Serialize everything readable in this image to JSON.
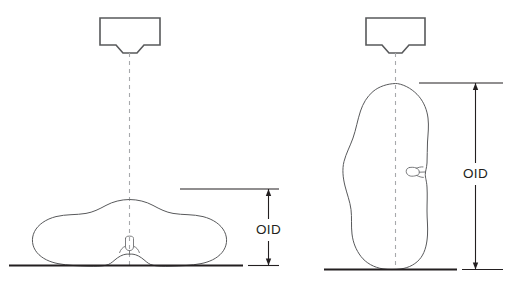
{
  "figure": {
    "stroke_color": "#58595b",
    "line_color": "#231f20",
    "dash_color": "#a7a9ac"
  },
  "panels": [
    {
      "id": "ap-projection",
      "name": "ap-projection-panel",
      "tube": {
        "name": "x-ray-tube-head",
        "collimator_name": "collimator"
      },
      "beam": {
        "name": "central-ray",
        "style": "dashed"
      },
      "patient": {
        "name": "patient-body-ap",
        "orientation": "supine-ap",
        "anatomy_marker": "vertebra"
      },
      "detector": {
        "name": "image-receptor-surface"
      },
      "dimension": {
        "name": "oid-dimension-ap",
        "label": "OID",
        "orientation": "vertical",
        "measures": "object-to-image-receptor-distance"
      }
    },
    {
      "id": "lateral-projection",
      "name": "lateral-projection-panel",
      "tube": {
        "name": "x-ray-tube-head",
        "collimator_name": "collimator"
      },
      "beam": {
        "name": "central-ray",
        "style": "dashed"
      },
      "patient": {
        "name": "patient-body-lateral",
        "orientation": "lateral-decubitus",
        "anatomy_marker": "vertebra"
      },
      "detector": {
        "name": "image-receptor-surface"
      },
      "dimension": {
        "name": "oid-dimension-lateral",
        "label": "OID",
        "orientation": "vertical",
        "measures": "object-to-image-receptor-distance"
      }
    }
  ],
  "labels": {
    "oid_left": "OID",
    "oid_right": "OID"
  }
}
